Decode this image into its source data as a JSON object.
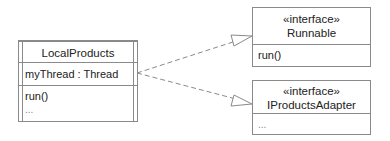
{
  "diagram": {
    "type": "uml-class-diagram",
    "classes": [
      {
        "id": "local",
        "name": "LocalProducts",
        "stereotype": "",
        "active": true,
        "attributes": [
          "myThread : Thread"
        ],
        "operations": [
          "run()",
          "..."
        ]
      },
      {
        "id": "runnable",
        "name": "Runnable",
        "stereotype": "«interface»",
        "operations": [
          "run()"
        ]
      },
      {
        "id": "adapter",
        "name": "IProductsAdapter",
        "stereotype": "«interface»",
        "operations": [
          "..."
        ]
      }
    ],
    "relations": [
      {
        "type": "realization",
        "from": "LocalProducts",
        "to": "Runnable",
        "style": "dashed-hollow-triangle"
      },
      {
        "type": "realization",
        "from": "LocalProducts",
        "to": "IProductsAdapter",
        "style": "dashed-hollow-triangle"
      }
    ],
    "colors": {
      "line": "#8a8a8a",
      "text": "#222222",
      "background": "#ffffff"
    }
  }
}
